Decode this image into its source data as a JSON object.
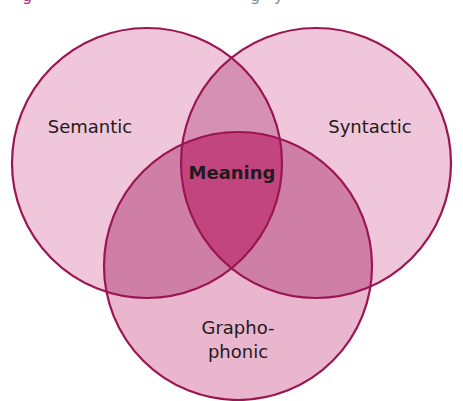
{
  "caption": {
    "visible_fragments": [
      {
        "text": "g",
        "x": 22,
        "color": "#b0306a"
      },
      {
        "text": "g",
        "x": 250,
        "color": "#8a8a8a"
      },
      {
        "text": "y",
        "x": 274,
        "color": "#8a8a8a"
      }
    ]
  },
  "diagram": {
    "type": "venn-3",
    "colors": {
      "stroke": "#9b1552",
      "fill_single": "#f0c6da",
      "fill_overlap_blend": "#c8437f",
      "label_text": "#231a20"
    },
    "circles": [
      {
        "name": "semantic",
        "label": "Semantic",
        "cx": 147,
        "cy": 163,
        "r": 135
      },
      {
        "name": "syntactic",
        "label": "Syntactic",
        "cx": 316,
        "cy": 163,
        "r": 135
      },
      {
        "name": "graphophonic",
        "label_line1": "Grapho-",
        "label_line2": "phonic",
        "cx": 238,
        "cy": 266,
        "r": 134
      }
    ],
    "center_label": "Meaning"
  }
}
